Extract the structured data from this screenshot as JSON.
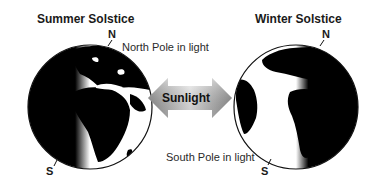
{
  "diagram": {
    "left_panel": {
      "title": "Summer Solstice",
      "north_label": "N",
      "south_label": "S",
      "annotation": "North Pole in light"
    },
    "center": {
      "arrow_label": "Sunlight"
    },
    "right_panel": {
      "title": "Winter Solstice",
      "north_label": "N",
      "south_label": "S",
      "annotation": "South Pole in light"
    },
    "colors": {
      "background": "#ffffff",
      "globe_dark": "#0a0a0a",
      "land_light": "#ffffff",
      "arrow_light": "#f2f2f2",
      "arrow_dark": "#9a9a9a",
      "text": "#1a1a1a"
    }
  }
}
